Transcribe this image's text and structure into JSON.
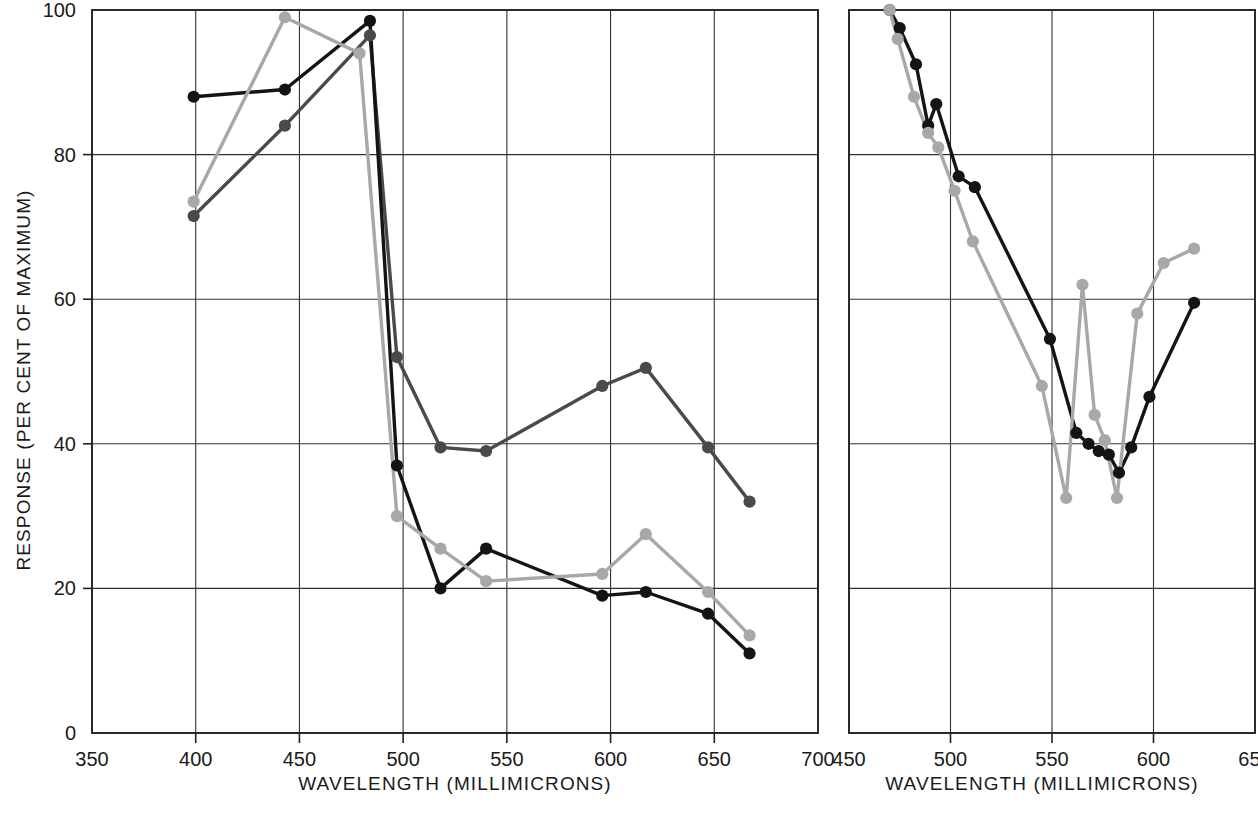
{
  "figure": {
    "background": "#ffffff",
    "panel_count": 2
  },
  "chart_data": [
    {
      "id": "left-panel",
      "type": "line",
      "title": "",
      "xlabel": "WAVELENGTH (MILLIMICRONS)",
      "ylabel": "RESPONSE (PER CENT OF MAXIMUM)",
      "xlim": [
        350,
        700
      ],
      "ylim": [
        0,
        100
      ],
      "xticks": [
        350,
        400,
        450,
        500,
        550,
        600,
        650,
        700
      ],
      "yticks": [
        0,
        20,
        40,
        60,
        80,
        100
      ],
      "xtick_labels": [
        "350",
        "400",
        "450",
        "500",
        "550",
        "600",
        "650",
        "700"
      ],
      "ytick_labels": [
        "0",
        "20",
        "40",
        "60",
        "80",
        "100"
      ],
      "grid": true,
      "grid_x": [
        400,
        450,
        500,
        550,
        600,
        650
      ],
      "grid_y": [
        20,
        40,
        60,
        80
      ],
      "legend": "none",
      "marker": "filled-circle",
      "series": [
        {
          "name": "series-dark-gray",
          "color": "#4a4a4a",
          "x": [
            399,
            443,
            484,
            497,
            518,
            540,
            596,
            617,
            647,
            667
          ],
          "y": [
            71.5,
            84,
            96.5,
            52,
            39.5,
            39,
            48,
            50.5,
            39.5,
            32
          ]
        },
        {
          "name": "series-black",
          "color": "#141414",
          "x": [
            399,
            443,
            484,
            497,
            518,
            540,
            596,
            617,
            647,
            667
          ],
          "y": [
            88,
            89,
            98.5,
            37,
            20,
            25.5,
            19,
            19.5,
            16.5,
            11
          ]
        },
        {
          "name": "series-light-gray",
          "color": "#a8a8a8",
          "x": [
            399,
            443,
            479,
            497,
            518,
            540,
            596,
            617,
            647,
            667
          ],
          "y": [
            73.5,
            99,
            94,
            30,
            25.5,
            21,
            22,
            27.5,
            19.5,
            13.5
          ]
        }
      ]
    },
    {
      "id": "right-panel",
      "type": "line",
      "title": "",
      "xlabel": "WAVELENGTH (MILLIMICRONS)",
      "ylabel": "",
      "xlim": [
        450,
        650
      ],
      "ylim": [
        0,
        100
      ],
      "xticks": [
        450,
        500,
        550,
        600,
        650
      ],
      "yticks": [
        0,
        20,
        40,
        60,
        80,
        100
      ],
      "xtick_labels": [
        "450",
        "500",
        "550",
        "600",
        "650"
      ],
      "ytick_labels": [],
      "grid": true,
      "grid_x": [
        500,
        550,
        600
      ],
      "grid_y": [
        20,
        40,
        60,
        80
      ],
      "legend": "none",
      "marker": "filled-circle",
      "series": [
        {
          "name": "series-black",
          "color": "#141414",
          "x": [
            470,
            475,
            483,
            489,
            493,
            504,
            512,
            549,
            562,
            568,
            573,
            578,
            583,
            589,
            598,
            620
          ],
          "y": [
            100,
            97.5,
            92.5,
            84,
            87,
            77,
            75.5,
            54.5,
            41.5,
            40,
            39,
            38.5,
            36,
            39.5,
            46.5,
            59.5
          ]
        },
        {
          "name": "series-light-gray",
          "color": "#a8a8a8",
          "x": [
            470,
            474,
            482,
            489,
            494,
            502,
            511,
            545,
            557,
            565,
            571,
            576,
            582,
            592,
            605,
            620
          ],
          "y": [
            100,
            96,
            88,
            83,
            81,
            75,
            68,
            48,
            32.5,
            62,
            44,
            40.5,
            32.5,
            58,
            65,
            67
          ]
        }
      ]
    }
  ]
}
